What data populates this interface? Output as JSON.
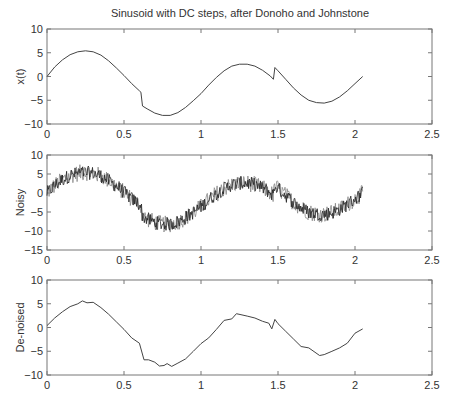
{
  "chart_data": [
    {
      "type": "line",
      "title": "Sinusoid with DC steps, after Donoho and Johnstone",
      "xlabel": "",
      "ylabel": "x(t)",
      "xlim": [
        0,
        2.5
      ],
      "ylim": [
        -10,
        10
      ],
      "xticks": [
        0,
        0.5,
        1,
        1.5,
        2,
        2.5
      ],
      "xtick_labels": [
        "0",
        "0.5",
        "1",
        "1.5",
        "2",
        "2.5"
      ],
      "yticks": [
        10,
        5,
        0,
        -5,
        -10
      ],
      "ytick_labels": [
        "10",
        "5",
        "0",
        "−10",
        "−5"
      ],
      "grid": false,
      "series": [
        {
          "name": "x(t)",
          "x": [
            0,
            0.05,
            0.1,
            0.15,
            0.2,
            0.25,
            0.3,
            0.35,
            0.4,
            0.45,
            0.5,
            0.55,
            0.6,
            0.61,
            0.62,
            0.65,
            0.7,
            0.75,
            0.8,
            0.85,
            0.9,
            0.95,
            1.0,
            1.05,
            1.1,
            1.15,
            1.2,
            1.25,
            1.3,
            1.35,
            1.4,
            1.45,
            1.47,
            1.48,
            1.5,
            1.55,
            1.6,
            1.65,
            1.7,
            1.75,
            1.8,
            1.85,
            1.9,
            1.95,
            2.0,
            2.05
          ],
          "y": [
            0,
            2.0,
            3.5,
            4.6,
            5.2,
            5.4,
            5.2,
            4.5,
            3.3,
            1.8,
            0.2,
            -1.5,
            -3.0,
            -3.3,
            -6.2,
            -6.8,
            -7.7,
            -8.2,
            -8.2,
            -7.6,
            -6.5,
            -5.1,
            -3.6,
            -1.8,
            -0.2,
            1.2,
            2.2,
            2.6,
            2.6,
            2.2,
            1.3,
            0.1,
            -0.6,
            1.9,
            1.2,
            -0.6,
            -2.4,
            -3.9,
            -5.0,
            -5.5,
            -5.6,
            -5.2,
            -4.3,
            -3.0,
            -1.5,
            0
          ]
        }
      ]
    },
    {
      "type": "line",
      "title": "",
      "xlabel": "",
      "ylabel": "Noisy",
      "xlim": [
        0,
        2.5
      ],
      "ylim": [
        -15,
        10
      ],
      "xticks": [
        0,
        0.5,
        1,
        1.5,
        2,
        2.5
      ],
      "xtick_labels": [
        "0",
        "0.5",
        "1",
        "1.5",
        "2",
        "2.5"
      ],
      "yticks": [
        10,
        5,
        0,
        -5,
        -10,
        -15
      ],
      "ytick_labels": [
        "10",
        "5",
        "0",
        "−5",
        "−10",
        "−15"
      ],
      "grid": false,
      "series": [
        {
          "name": "Noisy",
          "description": "x(t) plus additive noise of amplitude approximately ±2",
          "x_range": [
            0,
            2.05
          ],
          "noise_amplitude": 2
        }
      ]
    },
    {
      "type": "line",
      "title": "",
      "xlabel": "",
      "ylabel": "De-noised",
      "xlim": [
        0,
        2.5
      ],
      "ylim": [
        -10,
        10
      ],
      "xticks": [
        0,
        0.5,
        1,
        1.5,
        2,
        2.5
      ],
      "xtick_labels": [
        "0",
        "0.5",
        "1",
        "1.5",
        "2",
        "2.5"
      ],
      "yticks": [
        10,
        5,
        0,
        -5,
        -10
      ],
      "ytick_labels": [
        "10",
        "5",
        "0",
        "−5",
        "−10"
      ],
      "grid": false,
      "series": [
        {
          "name": "De-noised",
          "x": [
            0,
            0.05,
            0.1,
            0.15,
            0.2,
            0.23,
            0.26,
            0.3,
            0.35,
            0.4,
            0.45,
            0.5,
            0.55,
            0.6,
            0.63,
            0.66,
            0.7,
            0.73,
            0.76,
            0.78,
            0.81,
            0.85,
            0.9,
            0.95,
            1.0,
            1.05,
            1.1,
            1.15,
            1.2,
            1.23,
            1.26,
            1.3,
            1.35,
            1.4,
            1.44,
            1.46,
            1.48,
            1.5,
            1.55,
            1.6,
            1.65,
            1.7,
            1.77,
            1.8,
            1.85,
            1.9,
            1.95,
            2.0,
            2.05
          ],
          "y": [
            0.4,
            2.0,
            3.3,
            4.4,
            5.0,
            5.6,
            5.2,
            5.3,
            4.2,
            2.8,
            1.2,
            -0.4,
            -2.2,
            -3.3,
            -6.8,
            -6.8,
            -7.3,
            -8.1,
            -8.0,
            -7.6,
            -8.2,
            -7.5,
            -6.6,
            -5.0,
            -3.4,
            -2.2,
            -0.4,
            1.5,
            1.8,
            2.9,
            2.7,
            2.4,
            2.0,
            1.3,
            0.9,
            -0.3,
            1.7,
            0.8,
            -0.8,
            -2.4,
            -4.0,
            -4.3,
            -5.9,
            -5.7,
            -5.0,
            -4.3,
            -3.3,
            -1.2,
            -0.3
          ]
        }
      ]
    }
  ]
}
